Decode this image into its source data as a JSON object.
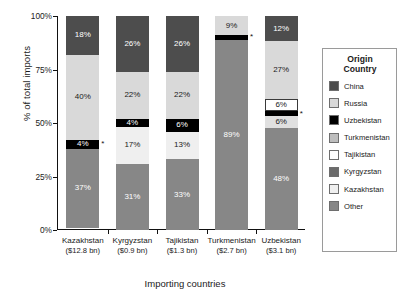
{
  "chart_data": {
    "type": "bar",
    "subtype": "stacked-bar-100",
    "title": "",
    "xlabel": "Importing countries",
    "ylabel": "% of total imports",
    "ylim": [
      0,
      100
    ],
    "ytick_labels": [
      "0%",
      "25%",
      "50%",
      "75%",
      "100%"
    ],
    "ytick_values": [
      0,
      25,
      50,
      75,
      100
    ],
    "grid": false,
    "legend_position": "right",
    "legend_title": "Origin\nCountry",
    "categories": [
      "Kazakhstan",
      "Kyrgyzstan",
      "Tajikistan",
      "Turkmenistan",
      "Uzbekistan"
    ],
    "category_sublabels": [
      "($12.8 bn)",
      "($0.9 bn)",
      "($1.3 bn)",
      "($2.7 bn)",
      "($3.1 bn)"
    ],
    "series": [
      {
        "name": "China",
        "color": "#4d4d4d",
        "values": [
          18,
          26,
          26,
          0,
          12
        ]
      },
      {
        "name": "Russia",
        "color": "#d9d9d9",
        "values": [
          40,
          22,
          22,
          9,
          27
        ]
      },
      {
        "name": "Uzbekistan",
        "color": "#000000",
        "values": [
          4,
          4,
          6,
          2,
          2
        ]
      },
      {
        "name": "Turkmenistan",
        "color": "#bdbdbd",
        "values": [
          0,
          0,
          0,
          0,
          6
        ]
      },
      {
        "name": "Tajikistan",
        "color": "#ffffff",
        "values": [
          0,
          0,
          0,
          0,
          6
        ]
      },
      {
        "name": "Kyrgyzstan",
        "color": "#6b6b6b",
        "values": [
          0,
          0,
          0,
          0,
          0
        ]
      },
      {
        "name": "Kazakhstan",
        "color": "#efefef",
        "values": [
          0,
          17,
          13,
          0,
          0
        ]
      },
      {
        "name": "Other",
        "color": "#878787",
        "values": [
          37,
          31,
          33,
          89,
          48
        ]
      }
    ],
    "bars": [
      {
        "category": "Kazakhstan",
        "sublabel": "($12.8 bn)",
        "segments": [
          {
            "origin": "China",
            "value": 18,
            "label": "18%",
            "color": "#4d4d4d",
            "text_color": "#ffffff",
            "show_label": true
          },
          {
            "origin": "Russia",
            "value": 40,
            "label": "40%",
            "color": "#d9d9d9",
            "text_color": "#1a1a1a",
            "show_label": true
          },
          {
            "origin": "Uzbekistan",
            "value": 4,
            "label": "4%",
            "color": "#000000",
            "text_color": "#ffffff",
            "show_label": true,
            "asterisk": true
          },
          {
            "origin": "Other",
            "value": 37,
            "label": "37%",
            "color": "#878787",
            "text_color": "#ffffff",
            "show_label": true
          }
        ]
      },
      {
        "category": "Kyrgyzstan",
        "sublabel": "($0.9 bn)",
        "segments": [
          {
            "origin": "China",
            "value": 26,
            "label": "26%",
            "color": "#4d4d4d",
            "text_color": "#ffffff",
            "show_label": true
          },
          {
            "origin": "Russia",
            "value": 22,
            "label": "22%",
            "color": "#d9d9d9",
            "text_color": "#1a1a1a",
            "show_label": true
          },
          {
            "origin": "Uzbekistan",
            "value": 4,
            "label": "4%",
            "color": "#000000",
            "text_color": "#ffffff",
            "show_label": true
          },
          {
            "origin": "Kazakhstan",
            "value": 17,
            "label": "17%",
            "color": "#efefef",
            "text_color": "#1a1a1a",
            "show_label": true
          },
          {
            "origin": "Other",
            "value": 31,
            "label": "31%",
            "color": "#878787",
            "text_color": "#ffffff",
            "show_label": true
          }
        ]
      },
      {
        "category": "Tajikistan",
        "sublabel": "($1.3 bn)",
        "segments": [
          {
            "origin": "China",
            "value": 26,
            "label": "26%",
            "color": "#4d4d4d",
            "text_color": "#ffffff",
            "show_label": true
          },
          {
            "origin": "Russia",
            "value": 22,
            "label": "22%",
            "color": "#d9d9d9",
            "text_color": "#1a1a1a",
            "show_label": true
          },
          {
            "origin": "Uzbekistan",
            "value": 6,
            "label": "6%",
            "color": "#000000",
            "text_color": "#ffffff",
            "show_label": true
          },
          {
            "origin": "Kazakhstan",
            "value": 13,
            "label": "13%",
            "color": "#efefef",
            "text_color": "#1a1a1a",
            "show_label": true
          },
          {
            "origin": "Other",
            "value": 33,
            "label": "33%",
            "color": "#878787",
            "text_color": "#ffffff",
            "show_label": true
          }
        ]
      },
      {
        "category": "Turkmenistan",
        "sublabel": "($2.7 bn)",
        "segments": [
          {
            "origin": "Russia",
            "value": 9,
            "label": "9%",
            "color": "#d9d9d9",
            "text_color": "#1a1a1a",
            "show_label": true
          },
          {
            "origin": "Uzbekistan",
            "value": 2,
            "label": "",
            "color": "#000000",
            "text_color": "#ffffff",
            "show_label": false,
            "asterisk": true
          },
          {
            "origin": "Other",
            "value": 89,
            "label": "89%",
            "color": "#878787",
            "text_color": "#ffffff",
            "show_label": true
          }
        ]
      },
      {
        "category": "Uzbekistan",
        "sublabel": "($3.1 bn)",
        "segments": [
          {
            "origin": "China",
            "value": 12,
            "label": "12%",
            "color": "#4d4d4d",
            "text_color": "#ffffff",
            "show_label": true
          },
          {
            "origin": "Russia",
            "value": 27,
            "label": "27%",
            "color": "#d9d9d9",
            "text_color": "#1a1a1a",
            "show_label": true
          },
          {
            "origin": "Tajikistan",
            "value": 6,
            "label": "6%",
            "color": "#ffffff",
            "text_color": "#1a1a1a",
            "show_label": true
          },
          {
            "origin": "Kyrgyzstan",
            "value": 2,
            "label": "",
            "color": "#000000",
            "text_color": "#ffffff",
            "show_label": false,
            "asterisk": true
          },
          {
            "origin": "Turkmenistan",
            "value": 6,
            "label": "6%",
            "color": "#e0e0e0",
            "text_color": "#1a1a1a",
            "show_label": true
          },
          {
            "origin": "Other",
            "value": 48,
            "label": "48%",
            "color": "#878787",
            "text_color": "#ffffff",
            "show_label": true
          }
        ]
      }
    ]
  },
  "legend": {
    "title_line1": "Origin",
    "title_line2": "Country",
    "items": [
      {
        "label": "China",
        "color": "#4d4d4d"
      },
      {
        "label": "Russia",
        "color": "#d9d9d9"
      },
      {
        "label": "Uzbekistan",
        "color": "#000000"
      },
      {
        "label": "Turkmenistan",
        "color": "#bdbdbd"
      },
      {
        "label": "Tajikistan",
        "color": "#ffffff"
      },
      {
        "label": "Kyrgyzstan",
        "color": "#6b6b6b"
      },
      {
        "label": "Kazakhstan",
        "color": "#efefef"
      },
      {
        "label": "Other",
        "color": "#878787"
      }
    ]
  },
  "axes": {
    "y_title": "% of total imports",
    "x_title": "Importing countries",
    "y_ticks": [
      "100%",
      "75%",
      "50%",
      "25%",
      "0%"
    ]
  }
}
